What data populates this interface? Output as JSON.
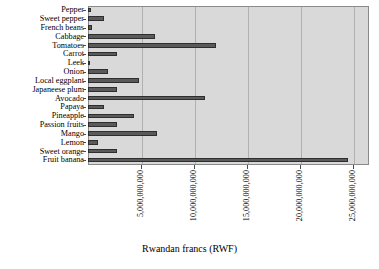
{
  "chart_data": {
    "type": "bar",
    "orientation": "horizontal",
    "title": "",
    "xlabel": "Rwandan francs (RWF)",
    "ylabel": "",
    "xlim": [
      0,
      26500000000
    ],
    "grid": true,
    "legend": null,
    "xticks": [
      "5,000,000,000",
      "10,000,000,000",
      "15,000,000,000",
      "20,000,000,000",
      "25,000,000,000"
    ],
    "xtick_values": [
      5000000000,
      10000000000,
      15000000000,
      20000000000,
      25000000000
    ],
    "categories": [
      "Pepper",
      "Sweet pepper",
      "French beans",
      "Cabbage",
      "Tomatoes",
      "Carrot",
      "Leek",
      "Onion",
      "Local eggplant",
      "Japaneese plum",
      "Avocado",
      "Papaya",
      "Pineapple",
      "Passion fruits",
      "Mango",
      "Lemon",
      "Sweet orange",
      "Fruit banana"
    ],
    "values": [
      300000000,
      1550000000,
      400000000,
      6300000000,
      12100000000,
      2700000000,
      200000000,
      1900000000,
      4800000000,
      2700000000,
      11000000000,
      1550000000,
      4350000000,
      2700000000,
      6550000000,
      950000000,
      2700000000,
      24500000000
    ],
    "bar_color": "#5a5a5a",
    "plot_background": "#d9d9d9"
  }
}
